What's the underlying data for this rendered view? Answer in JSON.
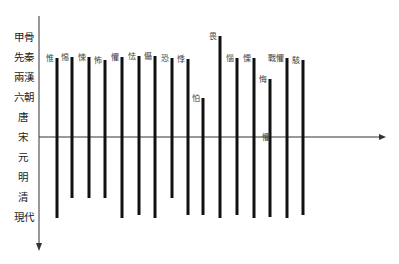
{
  "chart_data": {
    "type": "range-bar",
    "title": "",
    "xlabel": "",
    "ylabel": "",
    "orientation": "vertical bars spanning time periods (y-axis top to bottom)",
    "y_categories": [
      "甲骨",
      "先秦",
      "兩漢",
      "六朝",
      "唐",
      "宋",
      "元",
      "明",
      "清",
      "現代"
    ],
    "x_axis_at": "宋",
    "grid": false,
    "legend": null,
    "series": [
      {
        "name": "惟",
        "start": "先秦",
        "end": "現代"
      },
      {
        "name": "惕",
        "start": "先秦",
        "end": "清"
      },
      {
        "name": "悚",
        "start": "先秦",
        "end": "清"
      },
      {
        "name": "怖",
        "start": "先秦",
        "end": "清"
      },
      {
        "name": "懼",
        "start": "先秦",
        "end": "現代"
      },
      {
        "name": "怯",
        "start": "先秦",
        "end": "現代"
      },
      {
        "name": "懾",
        "start": "先秦",
        "end": "現代"
      },
      {
        "name": "恐",
        "start": "先秦",
        "end": "清"
      },
      {
        "name": "悸",
        "start": "先秦",
        "end": "現代"
      },
      {
        "name": "怕",
        "start": "六朝",
        "end": "現代"
      },
      {
        "name": "畏",
        "start": "甲骨",
        "end": "現代"
      },
      {
        "name": "惱",
        "start": "先秦",
        "end": "現代"
      },
      {
        "name": "慄",
        "start": "先秦",
        "end": "現代"
      },
      {
        "name": "悔",
        "start": "兩漢",
        "end": "現代"
      },
      {
        "name": "戰懼",
        "start": "先秦",
        "end": "現代"
      },
      {
        "name": "駭",
        "start": "先秦",
        "end": "現代"
      }
    ],
    "annotations": [
      {
        "text": "懼",
        "near": "宋 axis, right of 慄"
      }
    ]
  },
  "layout": {
    "y_positions": [
      37,
      57,
      77,
      97,
      117,
      137,
      157,
      177,
      197,
      217
    ],
    "bars": [
      {
        "x": 57,
        "top": 58,
        "bottom": 218
      },
      {
        "x": 72,
        "top": 57,
        "bottom": 198
      },
      {
        "x": 89,
        "top": 57,
        "bottom": 198
      },
      {
        "x": 105,
        "top": 60,
        "bottom": 198
      },
      {
        "x": 122,
        "top": 57,
        "bottom": 218
      },
      {
        "x": 139,
        "top": 56,
        "bottom": 215
      },
      {
        "x": 155,
        "top": 56,
        "bottom": 218
      },
      {
        "x": 172,
        "top": 58,
        "bottom": 198
      },
      {
        "x": 188,
        "top": 59,
        "bottom": 215
      },
      {
        "x": 203,
        "top": 98,
        "bottom": 215
      },
      {
        "x": 220,
        "top": 36,
        "bottom": 218
      },
      {
        "x": 237,
        "top": 58,
        "bottom": 215
      },
      {
        "x": 254,
        "top": 58,
        "bottom": 218
      },
      {
        "x": 270,
        "top": 79,
        "bottom": 217
      },
      {
        "x": 287,
        "top": 58,
        "bottom": 218
      },
      {
        "x": 303,
        "top": 60,
        "bottom": 215
      }
    ]
  }
}
